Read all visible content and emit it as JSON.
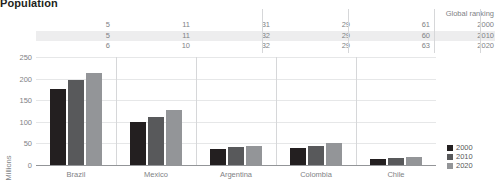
{
  "title": "Population",
  "ranking": {
    "header_label": "Global ranking",
    "years": [
      "2000",
      "2010",
      "2020"
    ],
    "rows": [
      {
        "year": "2000",
        "values": [
          "5",
          "11",
          "31",
          "29",
          "61"
        ]
      },
      {
        "year": "2010",
        "values": [
          "5",
          "11",
          "32",
          "29",
          "60"
        ]
      },
      {
        "year": "2020",
        "values": [
          "6",
          "10",
          "32",
          "29",
          "63"
        ]
      }
    ]
  },
  "legend": {
    "items": [
      {
        "label": "2000",
        "color": "#231f20"
      },
      {
        "label": "2010",
        "color": "#58595b"
      },
      {
        "label": "2020",
        "color": "#939598"
      }
    ]
  },
  "chart_data": {
    "type": "bar",
    "title": "Population",
    "xlabel": "",
    "ylabel": "Millions",
    "ylim": [
      0,
      250
    ],
    "yticks": [
      0,
      50,
      100,
      150,
      200,
      250
    ],
    "grid": true,
    "legend_position": "right",
    "categories": [
      "Brazil",
      "Mexico",
      "Argentina",
      "Colombia",
      "Chile"
    ],
    "series": [
      {
        "name": "2000",
        "color": "#231f20",
        "values": [
          175,
          99,
          37,
          40,
          15
        ]
      },
      {
        "name": "2010",
        "color": "#58595b",
        "values": [
          196,
          112,
          41,
          45,
          17
        ]
      },
      {
        "name": "2020",
        "color": "#939598",
        "values": [
          213,
          128,
          45,
          50,
          19
        ]
      }
    ],
    "annotations": {
      "global_ranking": {
        "label": "Global ranking",
        "Brazil": {
          "2000": 5,
          "2010": 5,
          "2020": 6
        },
        "Mexico": {
          "2000": 11,
          "2010": 11,
          "2020": 10
        },
        "Argentina": {
          "2000": 31,
          "2010": 32,
          "2020": 32
        },
        "Colombia": {
          "2000": 29,
          "2010": 29,
          "2020": 29
        },
        "Chile": {
          "2000": 61,
          "2010": 60,
          "2020": 63
        }
      }
    }
  }
}
